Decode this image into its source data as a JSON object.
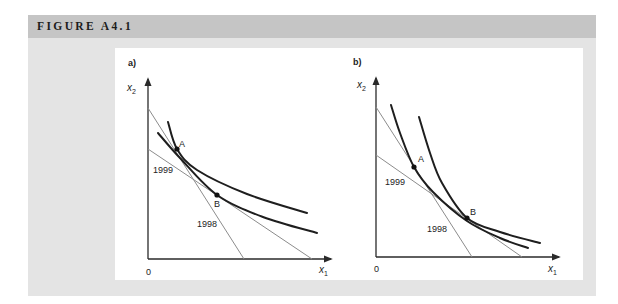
{
  "header": {
    "title": "FIGURE A4.1"
  },
  "figure": {
    "panels": [
      {
        "id": "a",
        "label": {
          "text": "a)",
          "pos": [
            128,
            66
          ]
        },
        "y_axis": {
          "from": [
            148,
            259
          ],
          "to": [
            148,
            79
          ]
        },
        "x_axis": {
          "from": [
            148,
            259
          ],
          "to": [
            331,
            259
          ]
        },
        "axis_labels": {
          "y": {
            "base": "x",
            "sub": "2",
            "pos": [
              127,
              91
            ]
          },
          "x": {
            "base": "x",
            "sub": "1",
            "pos": [
              319,
              273
            ]
          },
          "origin": {
            "text": "0",
            "pos": [
              146,
              275
            ]
          }
        },
        "budget_lines": [
          {
            "year": "1998",
            "from": [
              148,
              108
            ],
            "to": [
              244,
              259
            ],
            "label_pos": [
              197,
              227
            ]
          },
          {
            "year": "1999",
            "from": [
              148,
              149
            ],
            "to": [
              312,
              259
            ],
            "label_pos": [
              153,
              173
            ]
          }
        ],
        "curves": [
          {
            "name": "upper",
            "points": [
              [
                168,
                122
              ],
              [
                177,
                149
              ],
              [
                197,
                170
              ],
              [
                247,
                194
              ],
              [
                307,
                213
              ]
            ]
          },
          {
            "name": "lower",
            "points": [
              [
                158,
                133
              ],
              [
                180,
                158
              ],
              [
                217,
                195
              ],
              [
                263,
                217
              ],
              [
                317,
                233
              ]
            ]
          }
        ],
        "points": [
          {
            "label": "A",
            "pos": [
              177,
              149
            ],
            "label_pos": [
              179,
              147
            ]
          },
          {
            "label": "B",
            "pos": [
              217,
              195
            ],
            "label_pos": [
              214,
              207
            ]
          }
        ]
      },
      {
        "id": "b",
        "label": {
          "text": "b)",
          "pos": [
            353,
            65
          ]
        },
        "y_axis": {
          "from": [
            376,
            257
          ],
          "to": [
            376,
            78
          ]
        },
        "x_axis": {
          "from": [
            376,
            257
          ],
          "to": [
            559,
            257
          ]
        },
        "axis_labels": {
          "y": {
            "base": "x",
            "sub": "2",
            "pos": [
              357,
              88
            ]
          },
          "x": {
            "base": "x",
            "sub": "1",
            "pos": [
              548,
              272
            ]
          },
          "origin": {
            "text": "0",
            "pos": [
              374,
              272
            ]
          }
        },
        "budget_lines": [
          {
            "year": "1998",
            "from": [
              376,
              107
            ],
            "to": [
              472,
              257
            ],
            "label_pos": [
              427,
              232
            ]
          },
          {
            "year": "1999",
            "from": [
              376,
              155
            ],
            "to": [
              522,
              257
            ],
            "label_pos": [
              385,
              185
            ]
          }
        ],
        "curves": [
          {
            "name": "through-a",
            "points": [
              [
                391,
                105
              ],
              [
                400,
                133
              ],
              [
                414,
                167
              ],
              [
                433,
                192
              ],
              [
                467,
                221
              ],
              [
                500,
                238
              ],
              [
                528,
                248
              ]
            ]
          },
          {
            "name": "through-b",
            "points": [
              [
                419,
                117
              ],
              [
                430,
                153
              ],
              [
                442,
                183
              ],
              [
                467,
                218
              ],
              [
                500,
                232
              ],
              [
                540,
                243
              ]
            ]
          }
        ],
        "points": [
          {
            "label": "A",
            "pos": [
              414,
              167
            ],
            "label_pos": [
              418,
              162
            ]
          },
          {
            "label": "B",
            "pos": [
              467,
              218
            ],
            "label_pos": [
              470,
              215
            ]
          }
        ]
      }
    ]
  }
}
